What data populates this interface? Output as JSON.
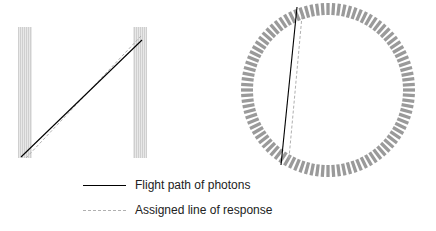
{
  "diagram": {
    "left_panel": {
      "detector_bars": [
        {
          "x": 18,
          "y": 27,
          "width": 14,
          "height": 131
        },
        {
          "x": 133,
          "y": 27,
          "width": 14,
          "height": 131
        }
      ],
      "flight_path": {
        "x1": 21,
        "y1": 157,
        "x2": 142,
        "y2": 40
      },
      "assigned_lor": {
        "x1": 26,
        "y1": 158,
        "x2": 141,
        "y2": 36
      }
    },
    "right_panel": {
      "ring": {
        "cx": 328,
        "cy": 90,
        "outer_r": 87,
        "inner_r": 75,
        "n_crystals": 96
      },
      "flight_path": {
        "x1": 297,
        "y1": 7,
        "x2": 281,
        "y2": 165
      },
      "assigned_lor": {
        "x1": 302,
        "y1": 16,
        "x2": 289,
        "y2": 158
      }
    },
    "colors": {
      "bar_fill": "#e4e4e4",
      "bar_stripe": "#c8c8c8",
      "crystal": "#9a9a9a",
      "flight_path": "#000000",
      "assigned_lor": "#b0b0b0"
    }
  },
  "legend": {
    "items": [
      {
        "label": "Flight path of photons",
        "style": "solid"
      },
      {
        "label": "Assigned line of response",
        "style": "dashed"
      }
    ]
  }
}
